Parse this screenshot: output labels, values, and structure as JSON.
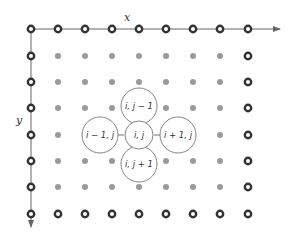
{
  "diagram": {
    "axes": {
      "x_label": "x",
      "y_label": "y"
    },
    "grid": {
      "columns": 9,
      "rows": 8,
      "col_x": [
        31,
        58,
        85,
        112,
        139,
        166,
        193,
        220,
        248
      ],
      "row_y": [
        29,
        56,
        82,
        108,
        135,
        161,
        187,
        214
      ],
      "boundary_node_style": "ring",
      "interior_node_style": "gray-dot"
    },
    "stencil": {
      "center": "i, j",
      "top": "i, j − 1",
      "bottom": "i, j + 1",
      "left": "i − 1, j",
      "right": "i + 1, j"
    },
    "colors": {
      "boundary": "#333333",
      "interior": "#9a9a9a",
      "axis": "#666666",
      "circle_stroke": "#777777"
    }
  }
}
